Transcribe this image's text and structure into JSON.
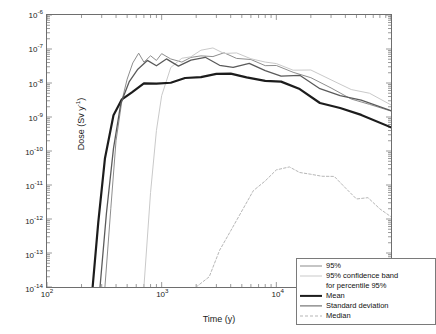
{
  "figure": {
    "title_faint": "",
    "background": "#ffffff",
    "frame_color": "#6e6e6e"
  },
  "axes": {
    "xlabel": "Time (y)",
    "ylabel_html": "Dose (Sv y<sup>-1</sup>)",
    "ylabel_plain": "Dose (Sv y-1)",
    "x_ticks": [
      "10",
      "10",
      "10",
      "10"
    ],
    "x_exponents": [
      "2",
      "3",
      "4",
      "5"
    ],
    "y_ticks": [
      "10",
      "10",
      "10",
      "10",
      "10",
      "10",
      "10",
      "10",
      "10"
    ],
    "y_exponents": [
      "-6",
      "-7",
      "-8",
      "-9",
      "-10",
      "-11",
      "-12",
      "-13",
      "-14"
    ]
  },
  "legend": {
    "entries": [
      {
        "label": "95%",
        "style": "solid",
        "color": "#8c8c8c",
        "width": 1.0
      },
      {
        "label": "95% confidence band",
        "style": "solid",
        "color": "#c9c9c9",
        "width": 1.0
      },
      {
        "label": "for percentile 95%",
        "style": "none",
        "color": "#c9c9c9",
        "width": 0
      },
      {
        "label": "Mean",
        "style": "solid",
        "color": "#1c1c1c",
        "width": 2.2
      },
      {
        "label": "Standard deviation",
        "style": "solid",
        "color": "#5a5a5a",
        "width": 1.2
      },
      {
        "label": "Median",
        "style": "dashed",
        "color": "#b5b5b5",
        "width": 1.0
      }
    ]
  },
  "chart_data": {
    "type": "line",
    "title": "",
    "xlabel": "Time (y)",
    "ylabel": "Dose (Sv y-1)",
    "xscale": "log",
    "yscale": "log",
    "xlim": [
      100,
      100000
    ],
    "ylim": [
      1e-14,
      1e-06
    ],
    "grid": false,
    "legend_position": "lower right",
    "series": [
      {
        "name": "95%",
        "color": "#8c8c8c",
        "style": "solid",
        "x": [
          320,
          360,
          400,
          450,
          500,
          560,
          630,
          700,
          800,
          900,
          1000,
          1200,
          1500,
          1800,
          2200,
          2800,
          3500,
          4500,
          6000,
          8000,
          10000,
          14000,
          20000,
          30000,
          45000,
          65000,
          100000
        ],
        "y": [
          1e-14,
          2e-12,
          2e-10,
          3e-09,
          1.4e-08,
          4e-08,
          7e-08,
          5e-08,
          7e-08,
          4.5e-08,
          5.5e-08,
          4.2e-08,
          5e-08,
          4.2e-08,
          5.2e-08,
          6.2e-08,
          6e-08,
          5.5e-08,
          4.5e-08,
          3.6e-08,
          2.8e-08,
          2e-08,
          1.3e-08,
          7.5e-09,
          4.2e-09,
          2.6e-09,
          1.5e-09
        ]
      },
      {
        "name": "95% confidence band",
        "color": "#c9c9c9",
        "style": "solid",
        "x": [
          700,
          800,
          900,
          1000,
          1200,
          1500,
          1800,
          2200,
          2800,
          3500,
          4500,
          6000,
          8000,
          10000,
          14000,
          20000,
          30000,
          45000,
          65000,
          100000
        ],
        "y": [
          1e-14,
          6e-12,
          4e-10,
          4e-09,
          2.2e-08,
          5.5e-08,
          7e-08,
          8.2e-08,
          9e-08,
          8.4e-08,
          7.6e-08,
          6.4e-08,
          5.2e-08,
          4.2e-08,
          3e-08,
          2e-08,
          1.2e-08,
          6.8e-09,
          4e-09,
          2.3e-09
        ]
      },
      {
        "name": "Mean",
        "color": "#1c1c1c",
        "style": "solid",
        "x": [
          250,
          280,
          320,
          380,
          450,
          550,
          700,
          900,
          1200,
          1600,
          2200,
          3000,
          4000,
          5500,
          8000,
          11000,
          16000,
          24000,
          36000,
          55000,
          100000
        ],
        "y": [
          1e-14,
          8e-13,
          6e-11,
          1e-09,
          4e-09,
          7e-09,
          8.5e-09,
          1e-08,
          1.3e-08,
          1.6e-08,
          1.9e-08,
          2e-08,
          1.9e-08,
          1.6e-08,
          1.2e-08,
          8.5e-09,
          5.5e-09,
          3.2e-09,
          1.8e-09,
          1e-09,
          4.2e-10
        ]
      },
      {
        "name": "Standard deviation",
        "color": "#5a5a5a",
        "style": "solid",
        "x": [
          290,
          330,
          380,
          440,
          520,
          620,
          750,
          900,
          1100,
          1400,
          1800,
          2400,
          3200,
          4200,
          5800,
          8000,
          11000,
          16000,
          24000,
          36000,
          55000,
          100000
        ],
        "y": [
          1e-14,
          1.5e-12,
          1.2e-10,
          2.5e-09,
          1.1e-08,
          2.6e-08,
          3.6e-08,
          3.4e-08,
          3.8e-08,
          3.6e-08,
          4e-08,
          4.3e-08,
          4.2e-08,
          3.9e-08,
          3.3e-08,
          2.6e-08,
          1.9e-08,
          1.3e-08,
          7.8e-09,
          4.4e-09,
          2.6e-09,
          1.3e-09
        ]
      },
      {
        "name": "Median",
        "color": "#b5b5b5",
        "style": "dashed",
        "x": [
          2000,
          2600,
          3200,
          4000,
          5000,
          6300,
          8000,
          10000,
          13000,
          16000,
          20000,
          25000,
          32000,
          40000,
          50000,
          63000,
          80000,
          100000
        ],
        "y": [
          1e-14,
          2e-14,
          1.2e-13,
          6e-13,
          2.2e-12,
          6e-12,
          1.3e-11,
          2.2e-11,
          2.6e-11,
          2.3e-11,
          2.4e-11,
          2e-11,
          1.4e-11,
          8e-12,
          5e-12,
          4.2e-12,
          2.4e-12,
          1.2e-12
        ]
      }
    ]
  }
}
